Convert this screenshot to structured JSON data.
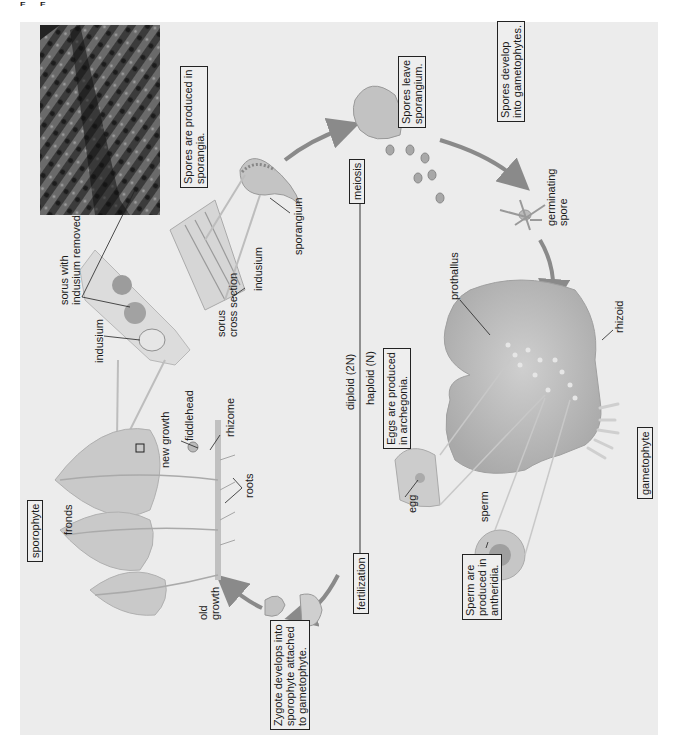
{
  "figure": {
    "corner_mark": "F F",
    "orientation": "rotated -90deg (text reads bottom-to-top)",
    "stage_labels": {
      "sporophyte": "sporophyte",
      "gametophyte": "gametophyte",
      "meiosis": "meiosis",
      "fertilization": "fertilization"
    },
    "ploidy": {
      "diploid": "diploid (2N)",
      "haploid": "haploid (N)"
    },
    "captions": {
      "spores_produced": "Spores are produced in\nsporangia.",
      "spores_leave": "Spores leave\nsporangium.",
      "spores_develop": "Spores develop\ninto gametophytes.",
      "eggs_produced": "Eggs are produced\nin archegonia.",
      "sperm_produced": "Sperm are\nproduced in\nantheridia.",
      "zygote_develops": "Zygote develops into\nsporophyte attached\nto gametophyte."
    },
    "structure_labels": {
      "sorus_with_indusium_removed": "sorus with\nindusium removed",
      "indusium_leaf": "indusium",
      "sorus_cross_section": "sorus\ncross section",
      "indusium_section": "indusium",
      "sporangium": "sporangium",
      "germinating_spore": "germinating\nspore",
      "prothallus": "prothallus",
      "rhizoid": "rhizoid",
      "egg": "egg",
      "sperm": "sperm",
      "fronds": "fronds",
      "new_growth": "new growth",
      "fiddlehead": "fiddlehead",
      "rhizome": "rhizome",
      "roots": "roots",
      "old_growth": "old\ngrowth"
    },
    "colors": {
      "panel_bg": "#ececec",
      "arrow": "#8a8a8a",
      "plant_fill": "#c8c8c8",
      "prothallus_fill": "#bdbdbd",
      "micrograph": "#3a3a3a",
      "text": "#1a1a1a"
    }
  }
}
